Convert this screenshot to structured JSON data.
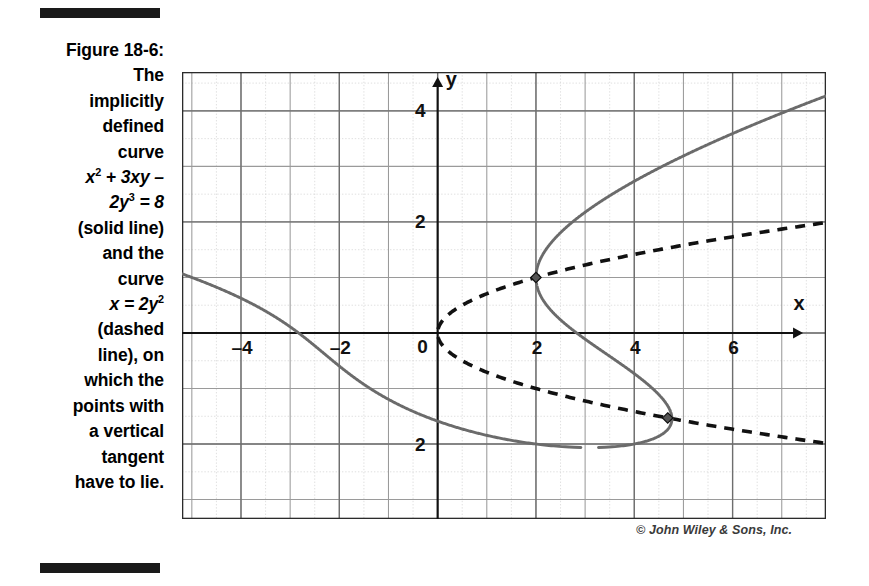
{
  "figure": {
    "label": "Figure 18-6:",
    "caption_lines": [
      "The",
      "implicitly",
      "defined",
      "curve"
    ],
    "equation1_html": "x<sup>2</sup> + 3xy –",
    "equation1_line2_html": "2y<sup>3</sup> = 8",
    "caption_lines2": [
      "(solid line)",
      "and the",
      "curve"
    ],
    "equation2_html": "x = 2y<sup>2</sup>",
    "caption_lines3": [
      "(dashed",
      "line), on",
      "which the",
      "points with",
      "a vertical",
      "tangent",
      "have to lie."
    ],
    "credit": "© John Wiley & Sons, Inc."
  },
  "chart_data": {
    "type": "line",
    "title": "",
    "xlabel": "x",
    "ylabel": "y",
    "xlim": [
      -5.2,
      7.9
    ],
    "ylim": [
      -3.35,
      4.7
    ],
    "xticks": [
      -4,
      -2,
      0,
      2,
      4,
      6
    ],
    "yticks": [
      4,
      2,
      -2
    ],
    "xtick_labels": [
      "–4",
      "–2",
      "0",
      "2",
      "4",
      "6"
    ],
    "ytick_labels": [
      "4",
      "2",
      "2"
    ],
    "grid": true,
    "grid_major_step": 1,
    "grid_minor_step": 0.5,
    "legend": "none",
    "axis_origin_label": "0",
    "series": [
      {
        "name": "x^2 + 3xy - 2y^3 = 8",
        "style": "solid",
        "color": "#666666",
        "equation": "x^2 + 3xy - 2y^3 = 8"
      },
      {
        "name": "x = 2y^2",
        "style": "dashed",
        "color": "#111111",
        "equation": "x = 2y^2"
      }
    ],
    "markers": [
      {
        "label": "vertical tangent point",
        "x": 2.0,
        "y": 1.0
      },
      {
        "label": "vertical tangent point",
        "x": 4.68,
        "y": -1.53
      }
    ],
    "annotations": [
      {
        "text": "y",
        "x": 0.28,
        "y": 4.45
      },
      {
        "text": "x",
        "x": 7.35,
        "y": 0.42
      }
    ]
  }
}
